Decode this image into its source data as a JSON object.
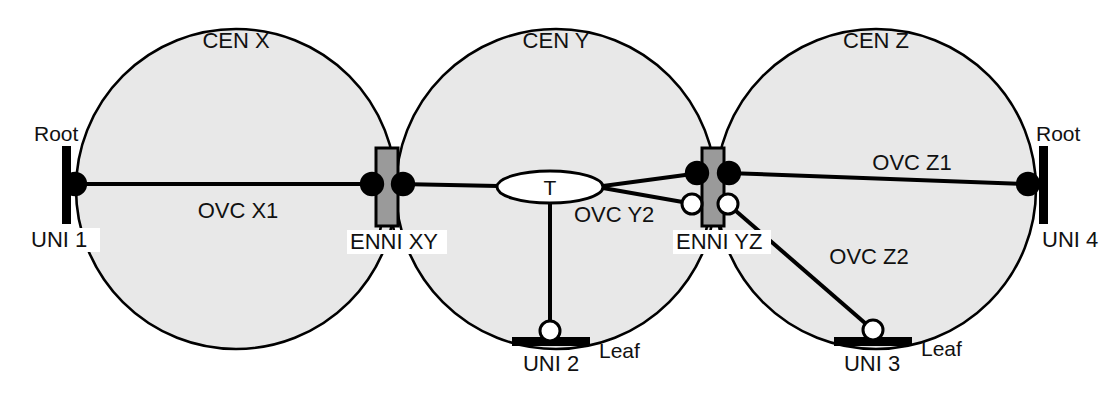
{
  "diagram": {
    "title_absent": true,
    "colors": {
      "cen_fill": "#e8e8e8",
      "cen_stroke": "#000000",
      "enni_fill": "#9a9a9a",
      "enni_stroke": "#000000",
      "root_marker_fill": "#000000",
      "leaf_marker_fill": "#ffffff",
      "line": "#000000",
      "label_bg": "#ffffff",
      "text": "#111111"
    },
    "cens": [
      {
        "id": "cen-x",
        "label": "CEN X",
        "cx": 236,
        "cy": 189,
        "r": 160
      },
      {
        "id": "cen-y",
        "label": "CEN Y",
        "cx": 556,
        "cy": 189,
        "r": 160
      },
      {
        "id": "cen-z",
        "label": "CEN Z",
        "cx": 876,
        "cy": 189,
        "r": 160
      }
    ],
    "unis": [
      {
        "id": "uni-1",
        "label": "UNI 1",
        "role": "Root",
        "orientation": "vertical",
        "marker": "filled",
        "bar_x": 62,
        "bar_y": 146,
        "bar_w": 9,
        "bar_h": 78,
        "dot_x": 75,
        "dot_y": 184,
        "label_x": 30,
        "label_y": 246,
        "role_x": 34,
        "role_y": 139
      },
      {
        "id": "uni-2",
        "label": "UNI 2",
        "role": "Leaf",
        "orientation": "horizontal",
        "marker": "hollow",
        "bar_x": 512,
        "bar_y": 337,
        "bar_w": 78,
        "bar_h": 9,
        "dot_x": 550,
        "dot_y": 331,
        "label_x": 519,
        "label_y": 370,
        "role_x": 600,
        "role_y": 357
      },
      {
        "id": "uni-3",
        "label": "UNI 3",
        "role": "Leaf",
        "orientation": "horizontal",
        "marker": "hollow",
        "bar_x": 834,
        "bar_y": 337,
        "bar_w": 78,
        "bar_h": 9,
        "dot_x": 873,
        "dot_y": 330,
        "label_x": 838,
        "label_y": 370,
        "role_x": 922,
        "role_y": 355
      },
      {
        "id": "uni-4",
        "label": "UNI 4",
        "role": "Root",
        "orientation": "vertical",
        "marker": "filled",
        "bar_x": 1039,
        "bar_y": 146,
        "bar_w": 9,
        "bar_h": 78,
        "dot_x": 1028,
        "dot_y": 184,
        "label_x": 1042,
        "label_y": 246,
        "role_x": 1036,
        "role_y": 139
      }
    ],
    "ennis": [
      {
        "id": "enni-xy",
        "label": "ENNI XY",
        "box_x": 376,
        "box_y": 148,
        "box_w": 22,
        "box_h": 78,
        "label_x": 348,
        "label_y": 248,
        "ports": [
          {
            "side": "left",
            "marker": "filled",
            "cx": 372,
            "cy": 184
          },
          {
            "side": "right",
            "marker": "filled",
            "cx": 403,
            "cy": 184
          }
        ]
      },
      {
        "id": "enni-yz",
        "label": "ENNI YZ",
        "box_x": 702,
        "box_y": 148,
        "box_w": 22,
        "box_h": 78,
        "label_x": 675,
        "label_y": 248,
        "ports": [
          {
            "side": "left",
            "marker": "filled",
            "cx": 697,
            "cy": 173
          },
          {
            "side": "right",
            "marker": "filled",
            "cx": 729,
            "cy": 173
          },
          {
            "side": "left",
            "marker": "hollow",
            "cx": 692,
            "cy": 204
          },
          {
            "side": "right",
            "marker": "hollow",
            "cx": 728,
            "cy": 204
          }
        ]
      }
    ],
    "transit": {
      "id": "transit-t",
      "label": "T",
      "cx": 550,
      "cy": 187,
      "rx": 53,
      "ry": 16,
      "label_x": 550,
      "label_y": 194
    },
    "ovcs": [
      {
        "id": "ovc-x1",
        "label": "OVC X1",
        "label_x": 200,
        "label_y": 216,
        "from": "uni-1",
        "to": "enni-xy"
      },
      {
        "id": "ovc-y2",
        "label": "OVC Y2",
        "label_x": 572,
        "label_y": 220,
        "from": "enni-xy",
        "to": "enni-yz-and-uni-2"
      },
      {
        "id": "ovc-z1",
        "label": "OVC Z1",
        "label_x": 863,
        "label_y": 168,
        "from": "enni-yz",
        "to": "uni-4"
      },
      {
        "id": "ovc-z2",
        "label": "OVC Z2",
        "label_x": 818,
        "label_y": 262,
        "from": "enni-yz",
        "to": "uni-3"
      }
    ]
  }
}
